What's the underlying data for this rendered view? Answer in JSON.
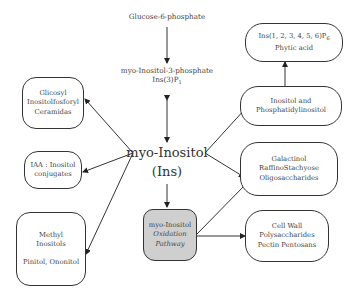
{
  "diagram": {
    "top_nodes": {
      "glucose6p": "Glucose-6-phosphate",
      "mip_line1": "myo-Inositol-3-phosphate",
      "mip_line2": "Ins(3)P",
      "mip_sub": "1"
    },
    "center": {
      "line1": "myo-Inositol",
      "line2": "(Ins)"
    },
    "left_nodes": [
      {
        "id": "glycosyl",
        "lines": [
          "Glicosyl",
          "Inositolfosforyl",
          "Ceramidas"
        ]
      },
      {
        "id": "iaa",
        "lines": [
          "IAA : Inositol",
          "conjugates"
        ]
      },
      {
        "id": "methyl",
        "lines": [
          "Methyl",
          "Inositols",
          "Pinitol, Ononitol"
        ]
      }
    ],
    "right_nodes": [
      {
        "id": "phytic",
        "line1_pre": "Ins(1, 2, 3, 4, 5, 6)P",
        "line1_sub": "6",
        "line2": "Phytic acid"
      },
      {
        "id": "inositol_pi",
        "lines": [
          "Inositol and",
          "Phosphatidylinositol"
        ]
      },
      {
        "id": "galactinol",
        "lines": [
          "Galactinol",
          "RaffinoStachyose",
          "Oligosaccharides"
        ]
      },
      {
        "id": "cellwall",
        "lines": [
          "Cell Wall",
          "Polysaccharides",
          "Pectin Pentosans"
        ]
      }
    ],
    "oxidation": {
      "lines": [
        "myo-Inositol",
        "Oxidation",
        "Pathway"
      ],
      "fill": "#cfcfcf"
    },
    "colors": {
      "stroke": "#333333",
      "text": "#444444"
    }
  }
}
